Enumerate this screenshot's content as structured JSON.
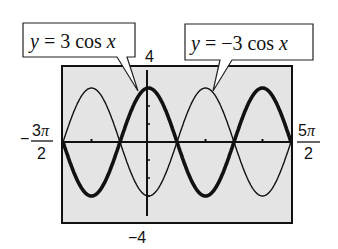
{
  "chart_data": {
    "type": "line",
    "title": "",
    "xlabel": "",
    "ylabel": "",
    "xlim": [
      -4.712389,
      7.853982
    ],
    "ylim": [
      -4,
      4
    ],
    "xlim_labels": {
      "min": "-3π/2",
      "max": "5π/2"
    },
    "ylim_labels": {
      "min": "-4",
      "max": "4"
    },
    "xscl": "π",
    "yscl": 1,
    "grid": false,
    "legend": "callouts",
    "series": [
      {
        "name": "y = 3 cos x",
        "function": "3*cos(x)",
        "amplitude": 3,
        "style": "thick",
        "x": [
          -4.712,
          -3.142,
          -1.571,
          0,
          1.571,
          3.142,
          4.712,
          6.283,
          7.854
        ],
        "y": [
          0,
          -3,
          0,
          3,
          0,
          -3,
          0,
          3,
          0
        ]
      },
      {
        "name": "y = -3 cos x",
        "function": "-3*cos(x)",
        "amplitude": 3,
        "style": "thin",
        "x": [
          -4.712,
          -3.142,
          -1.571,
          0,
          1.571,
          3.142,
          4.712,
          6.283,
          7.854
        ],
        "y": [
          0,
          3,
          0,
          -3,
          0,
          3,
          0,
          -3,
          0
        ]
      }
    ]
  },
  "labels": {
    "callout_left": {
      "y": "y",
      "eq": " = 3 cos ",
      "x": "x"
    },
    "callout_right": {
      "y": "y",
      "eq": " = −3 cos ",
      "x": "x"
    },
    "ymax": "4",
    "ymin": "−4",
    "xmin_sign": "−",
    "xmin_num": "3",
    "xmin_den": "2",
    "xmax_num": "5",
    "xmax_den": "2",
    "pi": "π"
  },
  "colors": {
    "screen_bg": "#e4e4e4",
    "frame": "#111111",
    "curve": "#111111"
  }
}
